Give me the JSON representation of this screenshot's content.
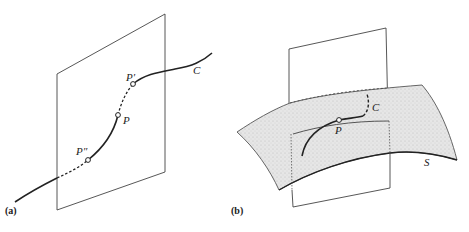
{
  "figure_a": {
    "caption": "(a)",
    "labels": {
      "curve": "C",
      "point_p": "P",
      "point_p_prime": "P′",
      "point_p_double_prime": "P″"
    }
  },
  "figure_b": {
    "caption": "(b)",
    "labels": {
      "curve": "C",
      "point_p": "P",
      "surface": "S"
    }
  },
  "colors": {
    "line": "#222222",
    "plane": "#444444",
    "surface_fill": "#e3e3e3"
  }
}
